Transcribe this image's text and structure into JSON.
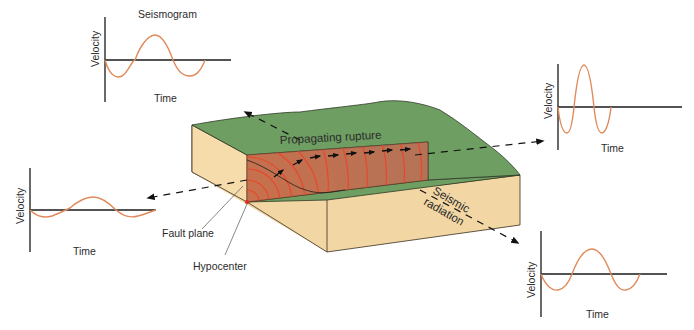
{
  "diagram": {
    "title": "Seismogram",
    "labels": {
      "propagating_rupture": "Propagating rupture",
      "seismic": "Seismic",
      "radiation": "radiation",
      "fault_plane": "Fault plane",
      "hypocenter": "Hypocenter"
    },
    "seismograms": [
      {
        "id": "top-left",
        "y_axis": "Velocity",
        "x_axis": "Time"
      },
      {
        "id": "top-right",
        "y_axis": "Velocity",
        "x_axis": "Time"
      },
      {
        "id": "left",
        "y_axis": "Velocity",
        "x_axis": "Time"
      },
      {
        "id": "bottom-right",
        "y_axis": "Velocity",
        "x_axis": "Time"
      }
    ],
    "colors": {
      "ground_surface": "#6e9e62",
      "block_side": "#f2d7a4",
      "fault_plane": "#b86a4c",
      "wavefront": "#e8472e",
      "waveform": "#e08a5a",
      "axis": "#1a1a1a",
      "hypocenter": "#e0281e"
    }
  }
}
